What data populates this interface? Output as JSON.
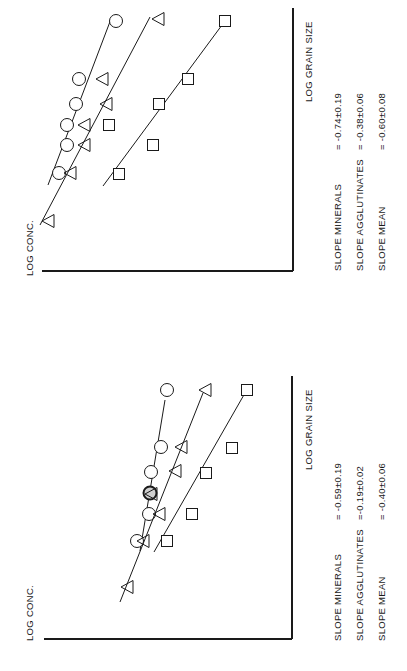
{
  "figure": {
    "orientation": "rotated-90-ccw",
    "ink_color": "#1a1a1a",
    "background": "#ffffff"
  },
  "chart_data": [
    {
      "type": "scatter",
      "panel": "top",
      "title": "",
      "xlabel": "LOG GRAIN SIZE",
      "ylabel": "LOG CONC.",
      "grid": false,
      "legend": "none (markers: circle=minerals, triangle=agglutinates, square=mean)",
      "axes_px": {
        "axis_x": 293,
        "axis_top": 8,
        "axis_bottom": 271,
        "axis_left": 42
      },
      "series": [
        {
          "name": "Minerals",
          "marker": "circle",
          "points_px": [
            [
              116,
              21
            ],
            [
              79,
              79
            ],
            [
              76,
              104
            ],
            [
              67,
              125
            ],
            [
              67,
              145
            ],
            [
              59,
              173
            ]
          ],
          "fit_line_px": [
            [
              48,
              185
            ],
            [
              111,
              19
            ]
          ],
          "slope_label": "SLOPE MINERALS",
          "slope_value": "= -0.74±0.19"
        },
        {
          "name": "Agglutinates",
          "marker": "triangle",
          "points_px": [
            [
              158,
              19
            ],
            [
              102,
              79
            ],
            [
              106,
              104
            ],
            [
              84,
              125
            ],
            [
              84,
              145
            ],
            [
              70,
              173
            ],
            [
              48,
              221
            ]
          ],
          "fit_line_px": [
            [
              40,
              225
            ],
            [
              150,
              17
            ]
          ],
          "slope_label": "SLOPE AGGLUTINATES",
          "slope_value": "= -0.38±0.06"
        },
        {
          "name": "Mean",
          "marker": "square",
          "points_px": [
            [
              225,
              21
            ],
            [
              188,
              79
            ],
            [
              159,
              104
            ],
            [
              109,
              125
            ],
            [
              153,
              145
            ],
            [
              119,
              174
            ]
          ],
          "fit_line_px": [
            [
              103,
              186
            ],
            [
              222,
              25
            ]
          ],
          "slope_label": "SLOPE MEAN",
          "slope_value": "= -0.60±0.08"
        }
      ]
    },
    {
      "type": "scatter",
      "panel": "bottom",
      "title": "",
      "xlabel": "LOG GRAIN SIZE",
      "ylabel": "LOG CONC.",
      "grid": false,
      "legend": "none (markers: circle=minerals, triangle=agglutinates, square=mean)",
      "axes_px": {
        "axis_x": 292,
        "axis_top": 376,
        "axis_bottom": 639,
        "axis_left": 44
      },
      "series": [
        {
          "name": "Minerals",
          "marker": "circle",
          "points_px": [
            [
              167,
              390
            ],
            [
              161,
              447
            ],
            [
              151,
              472
            ],
            [
              150,
              493
            ],
            [
              149,
              514
            ],
            [
              137,
              541
            ]
          ],
          "highlighted_point_index": 3,
          "fit_line_px": [
            [
              140,
              551
            ],
            [
              165,
              400
            ]
          ],
          "slope_label": "SLOPE MINERALS",
          "slope_value": "= -0.59±0.19"
        },
        {
          "name": "Agglutinates",
          "marker": "triangle",
          "points_px": [
            [
              205,
              390
            ],
            [
              181,
              447
            ],
            [
              175,
              471
            ],
            [
              151,
              494
            ],
            [
              159,
              514
            ],
            [
              143,
              541
            ],
            [
              127,
              587
            ]
          ],
          "fit_line_px": [
            [
              120,
              602
            ],
            [
              203,
              393
            ]
          ],
          "slope_label": "SLOPE AGGLUTINATES",
          "slope_value": "=-0.19±0.02"
        },
        {
          "name": "Mean",
          "marker": "square",
          "points_px": [
            [
              247,
              390
            ],
            [
              232,
              448
            ],
            [
              206,
              473
            ],
            [
              192,
              514
            ],
            [
              167,
              541
            ]
          ],
          "fit_line_px": [
            [
              154,
              552
            ],
            [
              245,
              393
            ]
          ],
          "slope_label": "SLOPE MEAN",
          "slope_value": "= -0.40±0.06"
        }
      ]
    }
  ],
  "panels": {
    "top": {
      "ylabel": "LOG CONC.",
      "xlabel": "LOG GRAIN SIZE",
      "slopes": [
        {
          "label": "SLOPE MINERALS",
          "value": "= -0.74±0.19"
        },
        {
          "label": "SLOPE AGGLUTINATES",
          "value": "= -0.38±0.06"
        },
        {
          "label": "SLOPE MEAN",
          "value": "= -0.60±0.08"
        }
      ]
    },
    "bottom": {
      "ylabel": "LOG CONC.",
      "xlabel": "LOG GRAIN SIZE",
      "slopes": [
        {
          "label": "SLOPE MINERALS",
          "value": "= -0.59±0.19"
        },
        {
          "label": "SLOPE AGGLUTINATES",
          "value": "=-0.19±0.02"
        },
        {
          "label": "SLOPE MEAN",
          "value": "= -0.40±0.06"
        }
      ]
    }
  }
}
